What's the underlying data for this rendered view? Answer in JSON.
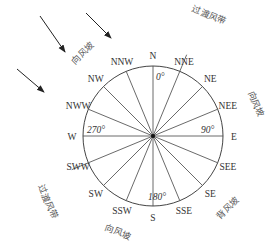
{
  "diagram": {
    "type": "wind-rose-slope-diagram",
    "center": {
      "x": 153,
      "y": 136
    },
    "radius": 70,
    "colors": {
      "line": "#444444",
      "text": "#333333",
      "zone_text": "#555555",
      "background": "#ffffff"
    },
    "directions": [
      {
        "label": "N",
        "angle": 0
      },
      {
        "label": "NNE",
        "angle": 22.5
      },
      {
        "label": "NE",
        "angle": 45
      },
      {
        "label": "NEE",
        "angle": 67.5
      },
      {
        "label": "E",
        "angle": 90
      },
      {
        "label": "SEE",
        "angle": 112.5
      },
      {
        "label": "SE",
        "angle": 135
      },
      {
        "label": "SSE",
        "angle": 157.5
      },
      {
        "label": "S",
        "angle": 180
      },
      {
        "label": "SSW",
        "angle": 202.5
      },
      {
        "label": "SW",
        "angle": 225
      },
      {
        "label": "SWW",
        "angle": 247.5
      },
      {
        "label": "W",
        "angle": 270
      },
      {
        "label": "NWW",
        "angle": 292.5
      },
      {
        "label": "NW",
        "angle": 315
      },
      {
        "label": "NNW",
        "angle": 337.5
      }
    ],
    "degree_labels": [
      {
        "label": "0°",
        "x": 156,
        "y": 80
      },
      {
        "label": "90°",
        "x": 201,
        "y": 133
      },
      {
        "label": "180°",
        "x": 148,
        "y": 200
      },
      {
        "label": "270°",
        "x": 87,
        "y": 133
      }
    ],
    "zones": [
      {
        "label": "向风坡",
        "meaning": "windward slope",
        "x": 85,
        "y": 55,
        "rotate": -45
      },
      {
        "label": "过渡风带",
        "meaning": "transition wind belt",
        "x": 208,
        "y": 18,
        "rotate": 22
      },
      {
        "label": "向风坡",
        "meaning": "windward slope",
        "x": 253,
        "y": 105,
        "rotate": 67
      },
      {
        "label": "过渡风带",
        "meaning": "transition wind belt",
        "x": 45,
        "y": 203,
        "rotate": 67
      },
      {
        "label": "向风坡",
        "meaning": "windward slope",
        "x": 117,
        "y": 235,
        "rotate": 20
      },
      {
        "label": "背风坡",
        "meaning": "leeward slope",
        "x": 230,
        "y": 210,
        "rotate": -45
      }
    ],
    "transition_axis": {
      "from_angle": 22.5,
      "to_angle": 247.5,
      "extend_to": 88
    },
    "wind_arrows": [
      {
        "x1": 40,
        "y1": 16,
        "x2": 65,
        "y2": 52
      },
      {
        "x1": 86,
        "y1": 13,
        "x2": 111,
        "y2": 38
      },
      {
        "x1": 17,
        "y1": 69,
        "x2": 44,
        "y2": 92
      }
    ]
  }
}
